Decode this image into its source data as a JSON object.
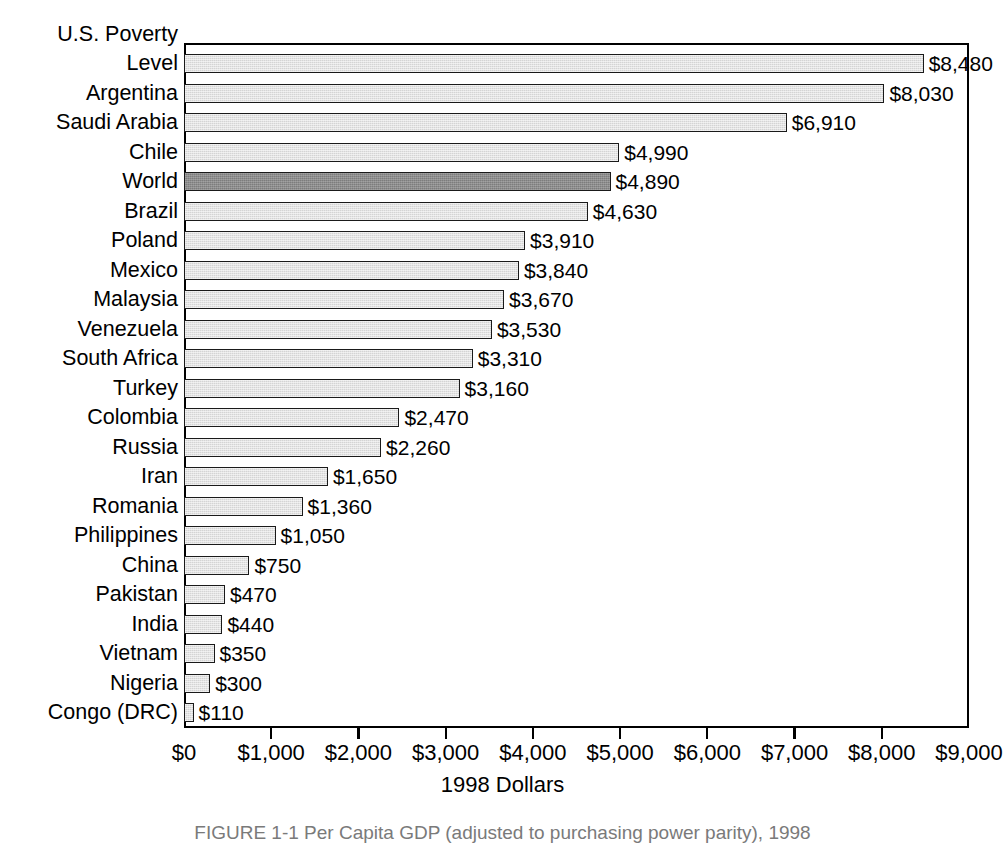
{
  "chart_data": {
    "type": "bar",
    "orientation": "horizontal",
    "title": "",
    "xlabel": "1998 Dollars",
    "ylabel": "",
    "xlim": [
      0,
      9000
    ],
    "xticks": [
      0,
      1000,
      2000,
      3000,
      4000,
      5000,
      6000,
      7000,
      8000,
      9000
    ],
    "xtick_labels": [
      "$0",
      "$1,000",
      "$2,000",
      "$3,000",
      "$4,000",
      "$5,000",
      "$6,000",
      "$7,000",
      "$8,000",
      "$9,000"
    ],
    "grid": false,
    "legend": "none",
    "highlight_category": "World",
    "categories": [
      "U.S. Poverty Level",
      "Argentina",
      "Saudi Arabia",
      "Chile",
      "World",
      "Brazil",
      "Poland",
      "Mexico",
      "Malaysia",
      "Venezuela",
      "South Africa",
      "Turkey",
      "Colombia",
      "Russia",
      "Iran",
      "Romania",
      "Philippines",
      "China",
      "Pakistan",
      "India",
      "Vietnam",
      "Nigeria",
      "Congo (DRC)"
    ],
    "values": [
      8480,
      8030,
      6910,
      4990,
      4890,
      4630,
      3910,
      3840,
      3670,
      3530,
      3310,
      3160,
      2470,
      2260,
      1650,
      1360,
      1050,
      750,
      470,
      440,
      350,
      300,
      110
    ],
    "value_labels": [
      "$8,480",
      "$8,030",
      "$6,910",
      "$4,990",
      "$4,890",
      "$4,630",
      "$3,910",
      "$3,840",
      "$3,670",
      "$3,530",
      "$3,310",
      "$3,160",
      "$2,470",
      "$2,260",
      "$1,650",
      "$1,360",
      "$1,050",
      "$750",
      "$470",
      "$440",
      "$350",
      "$300",
      "$110"
    ],
    "label_lines": [
      [
        "U.S. Poverty",
        "Level"
      ],
      [
        "Argentina"
      ],
      [
        "Saudi Arabia"
      ],
      [
        "Chile"
      ],
      [
        "World"
      ],
      [
        "Brazil"
      ],
      [
        "Poland"
      ],
      [
        "Mexico"
      ],
      [
        "Malaysia"
      ],
      [
        "Venezuela"
      ],
      [
        "South Africa"
      ],
      [
        "Turkey"
      ],
      [
        "Colombia"
      ],
      [
        "Russia"
      ],
      [
        "Iran"
      ],
      [
        "Romania"
      ],
      [
        "Philippines"
      ],
      [
        "China"
      ],
      [
        "Pakistan"
      ],
      [
        "India"
      ],
      [
        "Vietnam"
      ],
      [
        "Nigeria"
      ],
      [
        "Congo (DRC)"
      ]
    ],
    "colors": {
      "bar_fill": "#d4d4d4",
      "bar_highlight_fill": "#7d7d7d",
      "bar_border": "#1a1a1a",
      "axis": "#000000",
      "text": "#000000"
    }
  },
  "axis": {
    "title": "1998 Dollars"
  },
  "caption": {
    "text": "FIGURE 1-1  Per Capita GDP (adjusted to purchasing power parity), 1998"
  }
}
